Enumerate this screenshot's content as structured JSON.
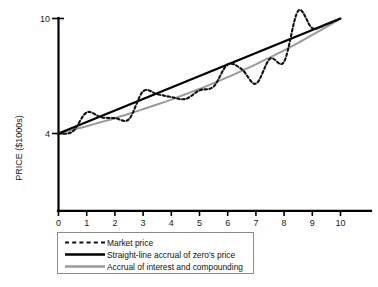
{
  "chart_data": {
    "type": "line",
    "title": "",
    "xlabel": "",
    "ylabel": "PRICE ($1000s)",
    "xlim": [
      0,
      10
    ],
    "ylim": [
      0,
      10
    ],
    "grid": false,
    "legend_position": "below",
    "xticks": [
      "0",
      "1",
      "2",
      "3",
      "4",
      "5",
      "6",
      "7",
      "8",
      "9",
      "10"
    ],
    "xtick_values": [
      0,
      1,
      2,
      3,
      4,
      5,
      6,
      7,
      8,
      9,
      10
    ],
    "yticks": [
      "4",
      "10"
    ],
    "ytick_values": [
      4,
      10
    ],
    "x": [
      0,
      0.5,
      1,
      1.5,
      2,
      2.5,
      3,
      3.5,
      4,
      4.5,
      5,
      5.5,
      6,
      6.5,
      7,
      7.5,
      8,
      8.5,
      9,
      9.5,
      10
    ],
    "series": [
      {
        "name": "Market price",
        "style": "dotted",
        "color": "#111111",
        "values": [
          4.0,
          4.1,
          5.1,
          4.85,
          4.8,
          4.75,
          6.2,
          6.05,
          5.9,
          5.8,
          6.25,
          6.45,
          7.6,
          7.35,
          6.6,
          7.9,
          7.75,
          10.4,
          9.5,
          9.7,
          10.0
        ]
      },
      {
        "name": "Straight-line accrual of zero's price",
        "style": "solid",
        "color": "#000000",
        "values": [
          4.0,
          4.3,
          4.6,
          4.9,
          5.2,
          5.5,
          5.8,
          6.1,
          6.4,
          6.7,
          7.0,
          7.3,
          7.6,
          7.9,
          8.2,
          8.5,
          8.8,
          9.1,
          9.4,
          9.7,
          10.0
        ]
      },
      {
        "name": "Accrual of interest and compounding",
        "style": "solid",
        "color": "#9a9a9a",
        "values": [
          4.0,
          4.19,
          4.38,
          4.59,
          4.8,
          5.03,
          5.27,
          5.51,
          5.77,
          6.05,
          6.32,
          6.63,
          6.94,
          7.27,
          7.61,
          7.97,
          8.34,
          8.73,
          9.14,
          9.56,
          10.0
        ]
      }
    ],
    "legend": [
      {
        "label": "Market price",
        "swatch": "dotted",
        "color": "#111111"
      },
      {
        "label": "Straight-line accrual of zero's price",
        "swatch": "solid",
        "color": "#000000"
      },
      {
        "label": "Accrual of interest and compounding",
        "swatch": "solid",
        "color": "#9a9a9a"
      }
    ]
  }
}
